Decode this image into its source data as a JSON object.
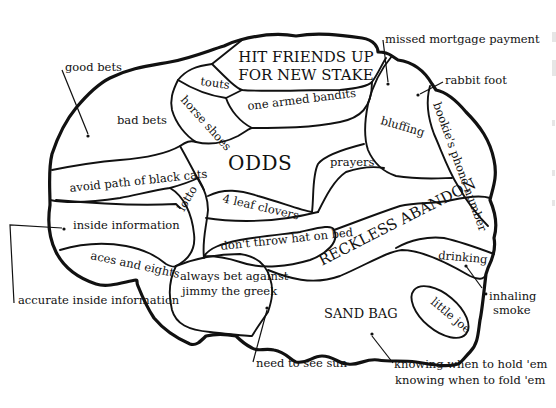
{
  "diagram": {
    "title": "ODDS",
    "colors": {
      "ink": "#111111",
      "background": "#ffffff"
    },
    "regions": [
      {
        "id": "hit-friends",
        "label_line1": "HIT FRIENDS UP",
        "label_line2": "FOR NEW STAKE"
      },
      {
        "id": "touts",
        "label": "touts"
      },
      {
        "id": "horse-shoes",
        "label": "horse shoes"
      },
      {
        "id": "one-armed-bandits",
        "label": "one armed bandits"
      },
      {
        "id": "bad-bets",
        "label": "bad bets"
      },
      {
        "id": "odds",
        "label": "ODDS"
      },
      {
        "id": "avoid-black-cats",
        "label": "avoid path of black cats"
      },
      {
        "id": "lotto",
        "label": "lotto"
      },
      {
        "id": "four-leaf-clovers",
        "label": "4 leaf clovers"
      },
      {
        "id": "prayers",
        "label": "prayers"
      },
      {
        "id": "bluffing",
        "label": "bluffing"
      },
      {
        "id": "bookies-phone-number",
        "label": "bookie's phone number"
      },
      {
        "id": "inside-information",
        "label": "inside information"
      },
      {
        "id": "dont-throw-hat",
        "label": "don't throw hat on bed"
      },
      {
        "id": "reckless-abandon",
        "label": "RECKLESS ABANDON"
      },
      {
        "id": "aces-and-eights",
        "label": "aces and eights"
      },
      {
        "id": "jimmy-the-greek",
        "label_line1": "always bet against",
        "label_line2": "jimmy the greek"
      },
      {
        "id": "drinking",
        "label": "drinking"
      },
      {
        "id": "sand-bag",
        "label": "SAND BAG"
      },
      {
        "id": "little-joe",
        "label": "little joe"
      }
    ],
    "callouts": [
      {
        "id": "good-bets",
        "label": "good bets"
      },
      {
        "id": "missed-mortgage",
        "label": "missed mortgage payment"
      },
      {
        "id": "rabbit-foot",
        "label": "rabbit foot"
      },
      {
        "id": "accurate-inside-info",
        "label": "accurate inside information"
      },
      {
        "id": "inhaling-smoke",
        "label_line1": "inhaling",
        "label_line2": "smoke"
      },
      {
        "id": "need-to-see-sun",
        "label": "need to see sun"
      },
      {
        "id": "hold-fold",
        "label_line1": "knowing when to hold 'em",
        "label_line2": "knowing when to fold 'em"
      }
    ]
  }
}
